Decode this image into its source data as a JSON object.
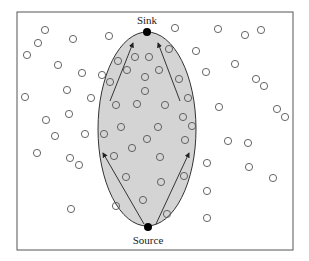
{
  "diagram": {
    "labels": {
      "sink": "Sink",
      "source": "Source"
    },
    "colors": {
      "frame": "#555555",
      "region_fill": "#d4d4d4",
      "region_stroke": "#333333",
      "node_stroke": "#555555",
      "endpoint": "#000000",
      "arrow": "#222222"
    },
    "frame": {
      "x": 17,
      "y": 12,
      "w": 276,
      "h": 238
    },
    "region": {
      "cx": 147,
      "cy": 129,
      "rx": 49,
      "ry": 97
    },
    "sink_point": {
      "x": 147,
      "y": 32
    },
    "source_point": {
      "x": 148,
      "y": 227
    },
    "arrows": [
      {
        "x1": 110,
        "y1": 101,
        "x2": 133,
        "y2": 43
      },
      {
        "x1": 180,
        "y1": 101,
        "x2": 158,
        "y2": 43
      },
      {
        "x1": 144,
        "y1": 224,
        "x2": 103,
        "y2": 153
      },
      {
        "x1": 156,
        "y1": 224,
        "x2": 189,
        "y2": 153
      }
    ],
    "nodes": [
      [
        45,
        30
      ],
      [
        38,
        43
      ],
      [
        27,
        55
      ],
      [
        73,
        39
      ],
      [
        109,
        36
      ],
      [
        58,
        65
      ],
      [
        82,
        73
      ],
      [
        102,
        75
      ],
      [
        110,
        82
      ],
      [
        67,
        90
      ],
      [
        91,
        98
      ],
      [
        25,
        97
      ],
      [
        69,
        114
      ],
      [
        46,
        120
      ],
      [
        55,
        136
      ],
      [
        85,
        134
      ],
      [
        37,
        153
      ],
      [
        70,
        158
      ],
      [
        79,
        165
      ],
      [
        71,
        209
      ],
      [
        118,
        61
      ],
      [
        135,
        57
      ],
      [
        149,
        57
      ],
      [
        127,
        70
      ],
      [
        159,
        70
      ],
      [
        145,
        77
      ],
      [
        145,
        91
      ],
      [
        169,
        49
      ],
      [
        179,
        79
      ],
      [
        188,
        98
      ],
      [
        116,
        105
      ],
      [
        137,
        104
      ],
      [
        165,
        105
      ],
      [
        183,
        117
      ],
      [
        192,
        126
      ],
      [
        121,
        127
      ],
      [
        158,
        127
      ],
      [
        104,
        134
      ],
      [
        147,
        139
      ],
      [
        185,
        140
      ],
      [
        132,
        148
      ],
      [
        114,
        156
      ],
      [
        160,
        157
      ],
      [
        126,
        177
      ],
      [
        161,
        182
      ],
      [
        184,
        176
      ],
      [
        143,
        200
      ],
      [
        167,
        214
      ],
      [
        116,
        206
      ],
      [
        175,
        28
      ],
      [
        218,
        29
      ],
      [
        245,
        35
      ],
      [
        261,
        30
      ],
      [
        196,
        51
      ],
      [
        235,
        64
      ],
      [
        206,
        72
      ],
      [
        256,
        79
      ],
      [
        264,
        86
      ],
      [
        219,
        107
      ],
      [
        277,
        109
      ],
      [
        285,
        117
      ],
      [
        228,
        141
      ],
      [
        248,
        143
      ],
      [
        207,
        163
      ],
      [
        249,
        167
      ],
      [
        273,
        178
      ],
      [
        207,
        191
      ],
      [
        207,
        218
      ]
    ]
  }
}
